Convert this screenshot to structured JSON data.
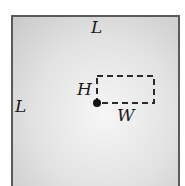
{
  "diagram": {
    "labels": {
      "top_side": "L",
      "left_side": "L",
      "height": "H",
      "width": "W"
    },
    "elements": {
      "outer_square": "square region of side L",
      "inner_rectangle": "dashed rectangle of width W and height H",
      "point": "filled dot at lower-left corner of dashed rectangle"
    },
    "colors": {
      "outline": "#5a5a5a",
      "dash": "#2a2a2a",
      "text": "#1a1a1a"
    }
  }
}
